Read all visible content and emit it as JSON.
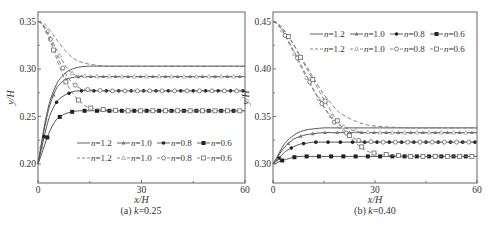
{
  "chart_data": [
    {
      "type": "line",
      "panel": "a",
      "caption": "(a) k=0.25",
      "caption_prefix": "(a) ",
      "caption_var": "k",
      "caption_value": "=0.25",
      "xlabel": "x/H",
      "ylabel": "y/H",
      "xlim": [
        0,
        60
      ],
      "ylim": [
        0.18,
        0.36
      ],
      "xticks": [
        0,
        30,
        60
      ],
      "xtick_labels": [
        "0",
        "30",
        "60"
      ],
      "yticks": [
        0.2,
        0.25,
        0.3,
        0.35
      ],
      "ytick_labels": [
        "0.20",
        "0.25",
        "0.30",
        "0.35"
      ],
      "grid": false,
      "legend_position": "lower right (inside)",
      "x": [
        0,
        1,
        2,
        3,
        4,
        5,
        6,
        8,
        10,
        12,
        15,
        20,
        25,
        30,
        40,
        50,
        60
      ],
      "series": [
        {
          "name": "n=1.2 (solid)",
          "style": "solid",
          "marker": "none",
          "values": [
            0.2,
            0.222,
            0.243,
            0.26,
            0.272,
            0.281,
            0.288,
            0.296,
            0.3,
            0.302,
            0.303,
            0.303,
            0.303,
            0.303,
            0.303,
            0.303,
            0.303
          ]
        },
        {
          "name": "n=1.0 (solid)",
          "style": "solid",
          "marker": "filled-triangle",
          "values": [
            0.2,
            0.22,
            0.24,
            0.256,
            0.268,
            0.277,
            0.283,
            0.289,
            0.291,
            0.292,
            0.292,
            0.292,
            0.292,
            0.292,
            0.292,
            0.292,
            0.292
          ]
        },
        {
          "name": "n=0.8 (solid)",
          "style": "solid",
          "marker": "filled-circle",
          "values": [
            0.2,
            0.216,
            0.232,
            0.246,
            0.256,
            0.263,
            0.268,
            0.273,
            0.276,
            0.277,
            0.277,
            0.277,
            0.277,
            0.277,
            0.277,
            0.277,
            0.277
          ]
        },
        {
          "name": "n=0.6 (solid)",
          "style": "solid",
          "marker": "filled-square",
          "values": [
            0.2,
            0.21,
            0.221,
            0.231,
            0.239,
            0.245,
            0.249,
            0.253,
            0.255,
            0.256,
            0.256,
            0.256,
            0.256,
            0.256,
            0.256,
            0.256,
            0.256
          ]
        },
        {
          "name": "n=1.2 (dashed)",
          "style": "dashed",
          "marker": "none",
          "values": [
            0.35,
            0.349,
            0.347,
            0.343,
            0.338,
            0.333,
            0.328,
            0.319,
            0.312,
            0.308,
            0.305,
            0.303,
            0.303,
            0.303,
            0.303,
            0.303,
            0.303
          ]
        },
        {
          "name": "n=1.0 (dashed)",
          "style": "dashed",
          "marker": "open-triangle",
          "values": [
            0.35,
            0.348,
            0.344,
            0.338,
            0.331,
            0.323,
            0.316,
            0.303,
            0.295,
            0.293,
            0.292,
            0.292,
            0.292,
            0.292,
            0.292,
            0.292,
            0.292
          ]
        },
        {
          "name": "n=0.8 (dashed)",
          "style": "dashed",
          "marker": "open-circle",
          "values": [
            0.35,
            0.348,
            0.343,
            0.336,
            0.328,
            0.319,
            0.31,
            0.295,
            0.285,
            0.28,
            0.278,
            0.277,
            0.277,
            0.277,
            0.277,
            0.277,
            0.277
          ]
        },
        {
          "name": "n=0.6 (dashed)",
          "style": "dashed",
          "marker": "open-square",
          "values": [
            0.35,
            0.348,
            0.342,
            0.334,
            0.325,
            0.315,
            0.305,
            0.287,
            0.275,
            0.266,
            0.259,
            0.257,
            0.256,
            0.256,
            0.256,
            0.256,
            0.256
          ]
        }
      ],
      "legend": {
        "row1": [
          "n=1.2",
          "n=1.0",
          "n=0.8",
          "n=0.6"
        ],
        "row2": [
          "n=1.2",
          "n=1.0",
          "n=0.8",
          "n=0.6"
        ]
      }
    },
    {
      "type": "line",
      "panel": "b",
      "caption": "(b) k=0.40",
      "caption_prefix": "(b) ",
      "caption_var": "k",
      "caption_value": "=0.40",
      "xlabel": "x/H",
      "ylabel": "y/H",
      "xlim": [
        0,
        60
      ],
      "ylim": [
        0.28,
        0.46
      ],
      "xticks": [
        0,
        30,
        60
      ],
      "xtick_labels": [
        "0",
        "30",
        "60"
      ],
      "yticks": [
        0.3,
        0.35,
        0.4,
        0.45
      ],
      "ytick_labels": [
        "0.30",
        "0.35",
        "0.40",
        "0.45"
      ],
      "grid": false,
      "legend_position": "upper right (inside)",
      "x": [
        0,
        1,
        2,
        3,
        4,
        6,
        8,
        10,
        12,
        15,
        18,
        20,
        25,
        30,
        40,
        50,
        60
      ],
      "series": [
        {
          "name": "n=1.2 (solid)",
          "style": "solid",
          "marker": "none",
          "values": [
            0.3,
            0.306,
            0.313,
            0.319,
            0.324,
            0.33,
            0.334,
            0.336,
            0.337,
            0.338,
            0.338,
            0.338,
            0.338,
            0.338,
            0.338,
            0.338,
            0.338
          ]
        },
        {
          "name": "n=1.0 (solid)",
          "style": "solid",
          "marker": "filled-triangle",
          "values": [
            0.3,
            0.305,
            0.311,
            0.316,
            0.32,
            0.326,
            0.329,
            0.331,
            0.332,
            0.333,
            0.333,
            0.333,
            0.333,
            0.333,
            0.333,
            0.333,
            0.333
          ]
        },
        {
          "name": "n=0.8 (solid)",
          "style": "solid",
          "marker": "filled-circle",
          "values": [
            0.3,
            0.303,
            0.307,
            0.311,
            0.314,
            0.318,
            0.321,
            0.322,
            0.323,
            0.323,
            0.323,
            0.323,
            0.323,
            0.323,
            0.323,
            0.323,
            0.323
          ]
        },
        {
          "name": "n=0.6 (solid)",
          "style": "solid",
          "marker": "filled-square",
          "values": [
            0.3,
            0.301,
            0.303,
            0.304,
            0.305,
            0.307,
            0.308,
            0.308,
            0.308,
            0.308,
            0.308,
            0.308,
            0.308,
            0.308,
            0.308,
            0.308,
            0.308
          ]
        },
        {
          "name": "n=1.2 (dashed)",
          "style": "dashed",
          "marker": "none",
          "values": [
            0.45,
            0.449,
            0.446,
            0.442,
            0.437,
            0.426,
            0.414,
            0.402,
            0.39,
            0.373,
            0.36,
            0.353,
            0.344,
            0.34,
            0.338,
            0.338,
            0.338
          ]
        },
        {
          "name": "n=1.0 (dashed)",
          "style": "dashed",
          "marker": "open-triangle",
          "values": [
            0.45,
            0.448,
            0.444,
            0.439,
            0.432,
            0.418,
            0.404,
            0.39,
            0.377,
            0.36,
            0.346,
            0.34,
            0.334,
            0.333,
            0.333,
            0.333,
            0.333
          ]
        },
        {
          "name": "n=0.8 (dashed)",
          "style": "dashed",
          "marker": "open-circle",
          "values": [
            0.45,
            0.448,
            0.444,
            0.439,
            0.433,
            0.42,
            0.406,
            0.392,
            0.378,
            0.36,
            0.344,
            0.336,
            0.325,
            0.323,
            0.323,
            0.323,
            0.323
          ]
        },
        {
          "name": "n=0.6 (dashed)",
          "style": "dashed",
          "marker": "open-square",
          "values": [
            0.45,
            0.449,
            0.446,
            0.442,
            0.437,
            0.426,
            0.413,
            0.4,
            0.387,
            0.368,
            0.35,
            0.34,
            0.32,
            0.311,
            0.308,
            0.308,
            0.308
          ]
        }
      ],
      "legend": {
        "row1": [
          "n=1.2",
          "n=1.0",
          "n=0.8",
          "n=0.6"
        ],
        "row2": [
          "n=1.2",
          "n=1.0",
          "n=0.8",
          "n=0.6"
        ]
      }
    }
  ],
  "colors": {
    "axis": "#555555",
    "solid_line": "#555555",
    "dashed_line": "#777777",
    "filled_marker": "#222222",
    "open_marker_stroke": "#666666",
    "background": "#ffffff"
  }
}
